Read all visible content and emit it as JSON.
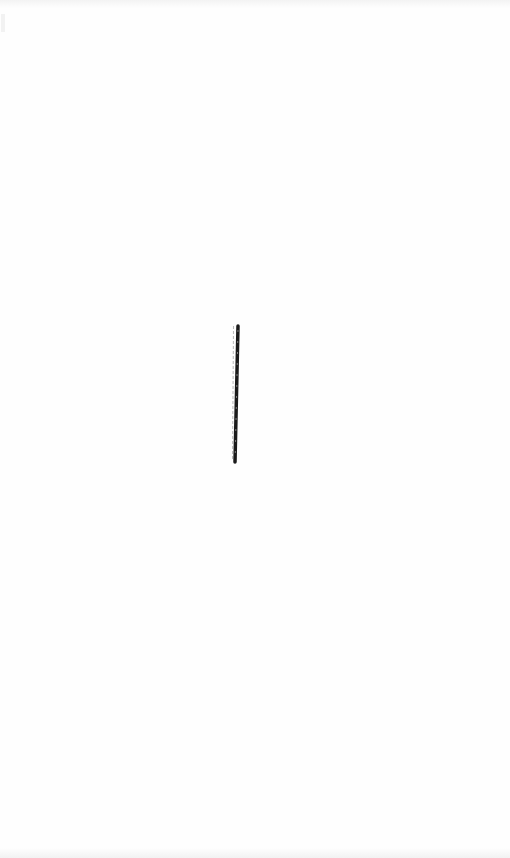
{
  "page": {
    "background_color": "#fefefe",
    "has_text": false
  },
  "stroke": {
    "label": "",
    "color": "#1b1b1b",
    "faint_color": "#b8b8b8",
    "start": {
      "x": 238,
      "y": 326
    },
    "end": {
      "x": 235,
      "y": 462
    },
    "width": 3.5
  }
}
